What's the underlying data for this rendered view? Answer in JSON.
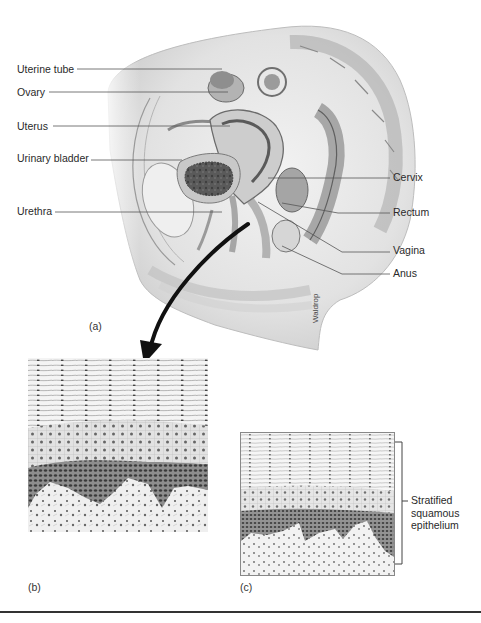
{
  "figure": {
    "panel_a": {
      "tag": "(a)",
      "signature": "Waldrop",
      "labels_left": [
        {
          "id": "uterine-tube",
          "text": "Uterine tube"
        },
        {
          "id": "ovary",
          "text": "Ovary"
        },
        {
          "id": "uterus",
          "text": "Uterus"
        },
        {
          "id": "urinary-bladder",
          "text": "Urinary bladder"
        },
        {
          "id": "urethra",
          "text": "Urethra"
        }
      ],
      "labels_right": [
        {
          "id": "cervix",
          "text": "Cervix"
        },
        {
          "id": "rectum",
          "text": "Rectum"
        },
        {
          "id": "vagina",
          "text": "Vagina"
        },
        {
          "id": "anus",
          "text": "Anus"
        }
      ]
    },
    "panel_b": {
      "tag": "(b)"
    },
    "panel_c": {
      "tag": "(c)",
      "bracket_label": [
        "Stratified",
        "squamous",
        "epithelium"
      ]
    }
  }
}
